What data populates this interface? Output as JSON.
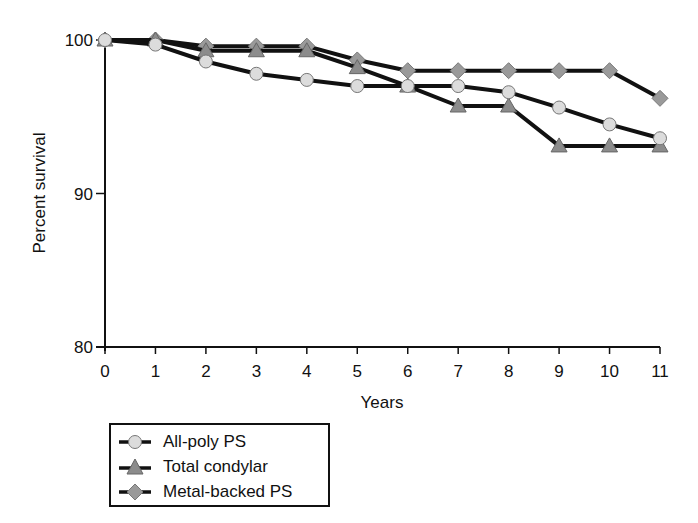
{
  "chart_data": {
    "type": "line",
    "title": "",
    "xlabel": "Years",
    "ylabel": "Percent survival",
    "x": [
      0,
      1,
      2,
      3,
      4,
      5,
      6,
      7,
      8,
      9,
      10,
      11
    ],
    "xlim": [
      0,
      11
    ],
    "ylim": [
      80,
      100
    ],
    "xticks": [
      "0",
      "1",
      "2",
      "3",
      "4",
      "5",
      "6",
      "7",
      "8",
      "9",
      "10",
      "11"
    ],
    "yticks": [
      "80",
      "90",
      "100"
    ],
    "grid": false,
    "legend_position": "below-left",
    "series": [
      {
        "name": "All-poly PS",
        "marker": "circle",
        "marker_color": "#dcdcdc",
        "values": [
          100,
          99.7,
          98.6,
          97.8,
          97.4,
          97.0,
          97.0,
          97.0,
          96.6,
          95.6,
          94.5,
          93.6
        ]
      },
      {
        "name": "Total condylar",
        "marker": "triangle",
        "marker_color": "#8c8c8c",
        "values": [
          100,
          100,
          99.3,
          99.3,
          99.3,
          98.2,
          97.0,
          95.7,
          95.7,
          93.1,
          93.1,
          93.1
        ]
      },
      {
        "name": "Metal-backed PS",
        "marker": "diamond",
        "marker_color": "#9a9a9a",
        "values": [
          100,
          100,
          99.6,
          99.6,
          99.6,
          98.7,
          98.0,
          98.0,
          98.0,
          98.0,
          98.0,
          96.2
        ]
      }
    ]
  },
  "legend": {
    "items": [
      {
        "label": "All-poly PS",
        "icon": "circle-marker-icon"
      },
      {
        "label": "Total condylar",
        "icon": "triangle-marker-icon"
      },
      {
        "label": "Metal-backed PS",
        "icon": "diamond-marker-icon"
      }
    ]
  }
}
